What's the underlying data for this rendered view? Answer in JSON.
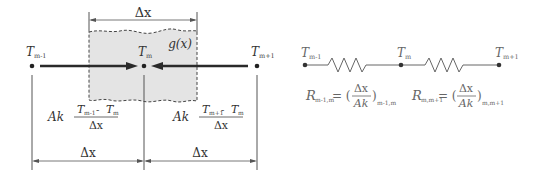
{
  "left_diagram": {
    "region_width_label": "Δx",
    "generation_label": "g(x)",
    "nodes": [
      {
        "name": "T",
        "sub": "m-1"
      },
      {
        "name": "T",
        "sub": "m"
      },
      {
        "name": "T",
        "sub": "m+1"
      }
    ],
    "flux_left": {
      "prefix": "Ak",
      "num_a": "T",
      "num_a_sub": "m-1",
      "minus": " - ",
      "num_b": "T",
      "num_b_sub": "m",
      "den": "Δx"
    },
    "flux_right": {
      "prefix": "Ak",
      "num_a": "T",
      "num_a_sub": "m+1",
      "minus": " - ",
      "num_b": "T",
      "num_b_sub": "m",
      "den": "Δx"
    },
    "spacing_left": "Δx",
    "spacing_right": "Δx"
  },
  "right_diagram": {
    "nodes": [
      {
        "name": "T",
        "sub": "m-1"
      },
      {
        "name": "T",
        "sub": "m"
      },
      {
        "name": "T",
        "sub": "m+1"
      }
    ],
    "r1": {
      "name": "R",
      "sub": "m-1,m",
      "eq": "= (",
      "num": "Δx",
      "den": "Ak",
      "close": ")",
      "after_sub": "m-1,m"
    },
    "r2": {
      "name": "R",
      "sub": "m,m+1",
      "eq": "= (",
      "num": "Δx",
      "den": "Ak",
      "close": ")",
      "after_sub": "m,m+1"
    }
  },
  "colors": {
    "shade": "#e6e6e6",
    "line": "#333333",
    "thin": "#555555"
  }
}
